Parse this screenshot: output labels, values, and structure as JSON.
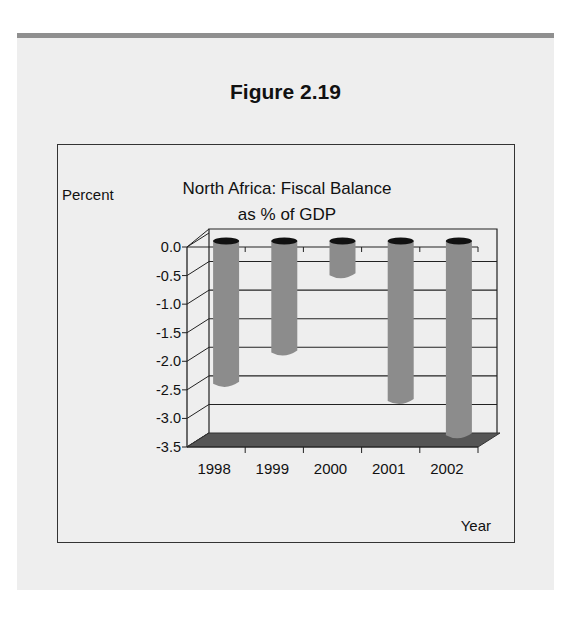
{
  "figure": {
    "label": "Figure 2.19"
  },
  "colors": {
    "panel_bg": "#eeeeee",
    "panel_band": "#8f8f8f",
    "bar": "#8c8c8c",
    "bar_cap": "#111111",
    "floor": "#555555",
    "axis": "#222222"
  },
  "chart_data": {
    "type": "bar",
    "title_lines": [
      "North Africa: Fiscal Balance",
      "as % of GDP"
    ],
    "xlabel": "Year",
    "ylabel": "Percent",
    "categories": [
      "1998",
      "1999",
      "2000",
      "2001",
      "2002"
    ],
    "values": [
      -2.5,
      -1.95,
      -0.6,
      -2.8,
      -3.4
    ],
    "ylim": [
      -3.5,
      0.0
    ],
    "yticks": [
      "0.0",
      "-0.5",
      "-1.0",
      "-1.5",
      "-2.0",
      "-2.5",
      "-3.0",
      "-3.5"
    ],
    "grid": true,
    "style": "3d-cylinder",
    "legend": null
  }
}
